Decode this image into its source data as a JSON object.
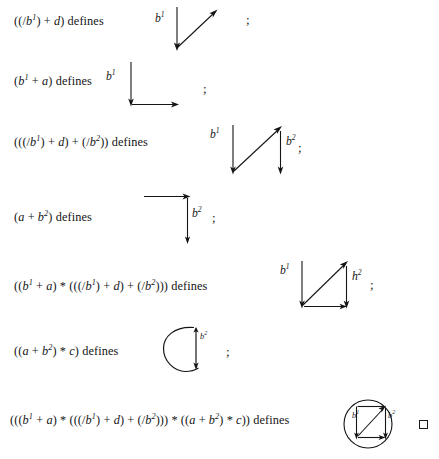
{
  "document": {
    "kind": "mathematical-proof-fragment",
    "defines_keyword": "defines",
    "separator": ";",
    "qed_symbol": "□",
    "ink_color": "#151515",
    "background_color": "#ffffff"
  },
  "lines": [
    {
      "id": "line-1",
      "expression_text": "((/b1) + d) defines",
      "expression_html": "((/<i>b</i><sup>1</sup>) + <i>d</i>) defines",
      "separator": ";",
      "diagram": {
        "name": "down-arrow-with-diagonal-up-arrow",
        "labels": [
          "b1"
        ],
        "arrows": [
          {
            "from": [
              0,
              0
            ],
            "to": [
              0,
              42
            ],
            "head": "end",
            "kind": "vertical-down"
          },
          {
            "from": [
              0,
              42
            ],
            "to": [
              36,
              6
            ],
            "head": "end",
            "kind": "diagonal-up-right"
          }
        ]
      }
    },
    {
      "id": "line-2",
      "expression_text": "(b1 + a) defines",
      "expression_html": "(<i>b</i><sup>1</sup> + <i>a</i>) defines",
      "separator": ";",
      "diagram": {
        "name": "down-arrow-then-right-arrow",
        "labels": [
          "b1"
        ],
        "arrows": [
          {
            "from": [
              0,
              0
            ],
            "to": [
              0,
              42
            ],
            "head": "end",
            "kind": "vertical-down"
          },
          {
            "from": [
              0,
              42
            ],
            "to": [
              44,
              42
            ],
            "head": "end",
            "kind": "horizontal-right"
          }
        ]
      }
    },
    {
      "id": "line-3",
      "expression_text": "(((/b1) + d) + (/b2)) defines",
      "expression_html": "(((/<i>b</i><sup>1</sup>) + <i>d</i>) + (/<i>b</i><sup>2</sup>)) defines",
      "separator": ";",
      "diagram": {
        "name": "two-down-arrows-with-diagonal",
        "labels": [
          "b1",
          "b2"
        ],
        "arrows": [
          {
            "from": [
              0,
              0
            ],
            "to": [
              0,
              48
            ],
            "head": "end",
            "kind": "vertical-down"
          },
          {
            "from": [
              0,
              48
            ],
            "to": [
              47,
              4
            ],
            "head": "end",
            "kind": "diagonal-up-right"
          },
          {
            "from": [
              47,
              4
            ],
            "to": [
              47,
              48
            ],
            "head": "end",
            "kind": "vertical-down"
          }
        ]
      }
    },
    {
      "id": "line-4",
      "expression_text": "(a + b2) defines",
      "expression_html": "(<i>a</i> + <i>b</i><sup>2</sup>) defines",
      "separator": ";",
      "diagram": {
        "name": "right-arrow-then-down-arrow",
        "labels": [
          "b2"
        ],
        "arrows": [
          {
            "from": [
              0,
              0
            ],
            "to": [
              46,
              0
            ],
            "head": "end",
            "kind": "horizontal-right"
          },
          {
            "from": [
              46,
              0
            ],
            "to": [
              46,
              48
            ],
            "head": "end",
            "kind": "vertical-down"
          }
        ]
      }
    },
    {
      "id": "line-5",
      "expression_text": "((b1 + a) * (((/b1) + d) + (/b2))) defines",
      "expression_html": "((<i>b</i><sup>1</sup> + <i>a</i>) &#42; (((/<i>b</i><sup>1</sup>) + <i>d</i>) + (/<i>b</i><sup>2</sup>))) defines",
      "separator": ";",
      "diagram": {
        "name": "triangle-with-two-down-arrows-and-base",
        "labels": [
          "b1",
          "h2"
        ],
        "arrows": [
          {
            "from": [
              0,
              0
            ],
            "to": [
              0,
              48
            ],
            "head": "end",
            "kind": "vertical-down"
          },
          {
            "from": [
              0,
              48
            ],
            "to": [
              45,
              3
            ],
            "head": "end",
            "kind": "diagonal-up-right"
          },
          {
            "from": [
              45,
              3
            ],
            "to": [
              45,
              48
            ],
            "head": "end",
            "kind": "vertical-down"
          },
          {
            "from": [
              0,
              48
            ],
            "to": [
              45,
              48
            ],
            "head": "end",
            "kind": "horizontal-right"
          }
        ]
      }
    },
    {
      "id": "line-6",
      "expression_text": "((a + b2) * c) defines",
      "expression_html": "((<i>a</i> + <i>b</i><sup>2</sup>) &#42; <i>c</i>) defines",
      "separator": ";",
      "diagram": {
        "name": "circle-loop-with-down-arrow",
        "labels": [
          "b2"
        ],
        "shape": "circle-with-vertical-chord-arrow"
      }
    },
    {
      "id": "line-7",
      "expression_text": "(((b1 + a) * (((/b1) + d) + (/b2))) * ((a + b2) * c)) defines",
      "expression_html": "(((<i>b</i><sup>1</sup> + <i>a</i>) &#42; (((/<i>b</i><sup>1</sup>) + <i>d</i>) + (/<i>b</i><sup>2</sup>))) &#42; ((<i>a</i> + <i>b</i><sup>2</sup>) &#42; <i>c</i>)) defines",
      "separator": "",
      "qed": "□",
      "diagram": {
        "name": "circle-with-inscribed-square-and-diagonal",
        "labels": [
          "b1",
          "b2"
        ],
        "shape": "circle-enclosing-square-with-diagonal-arrow"
      }
    }
  ]
}
